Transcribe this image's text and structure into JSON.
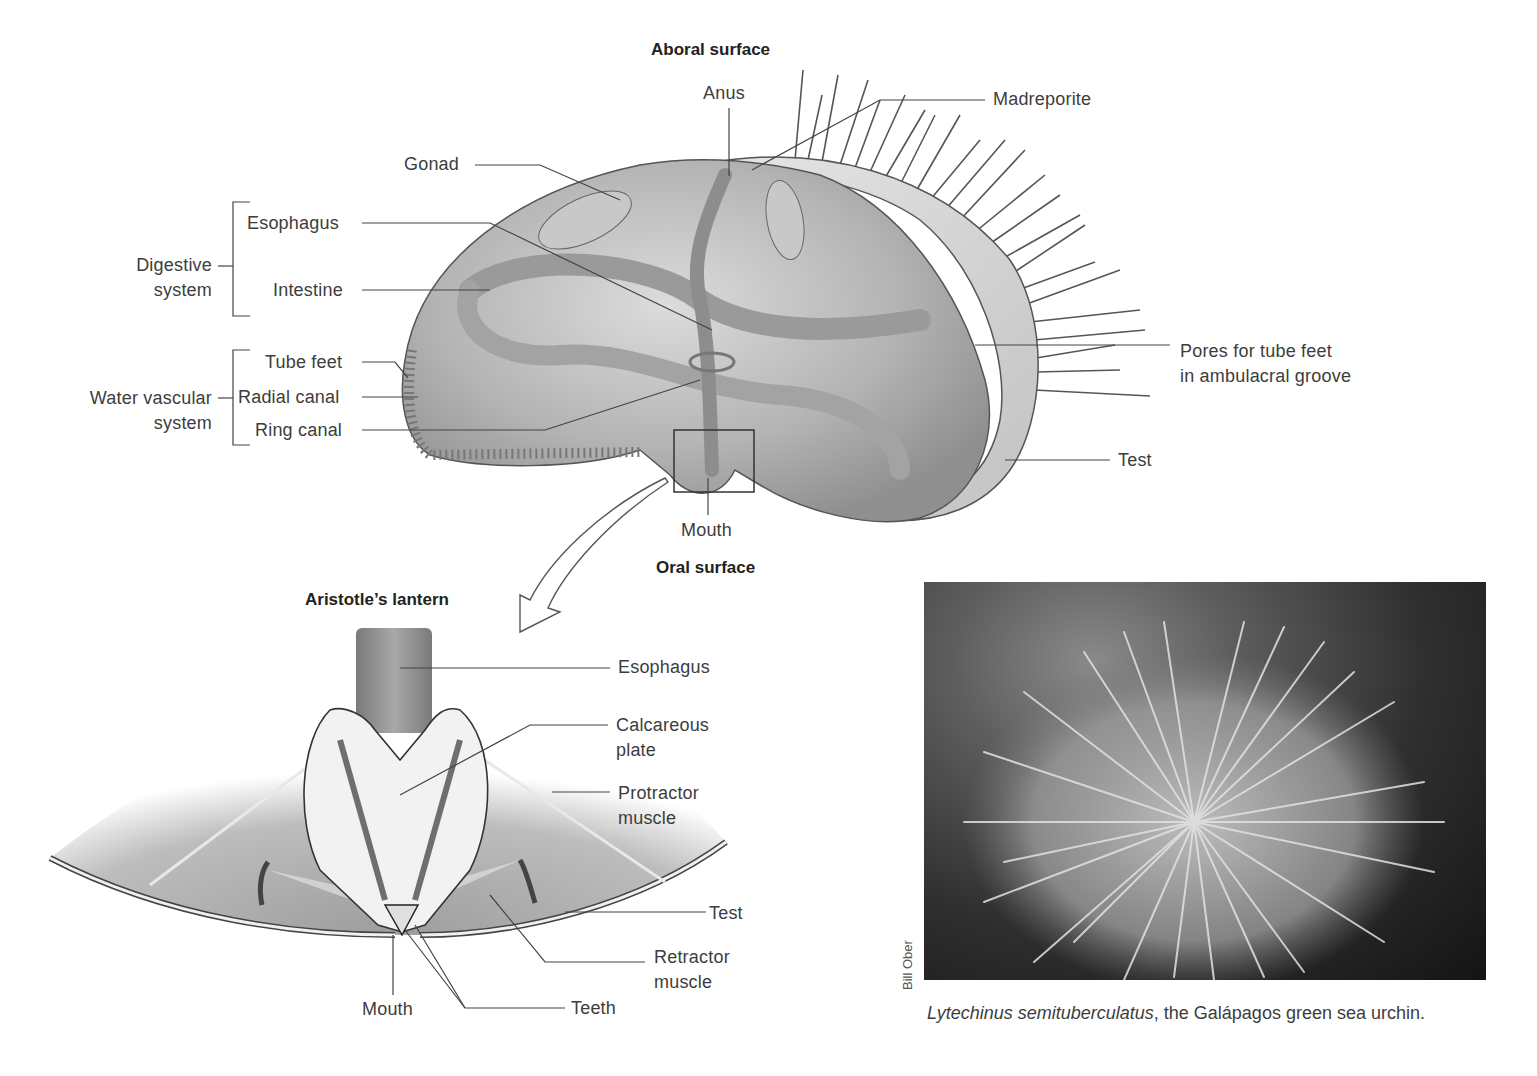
{
  "figure": {
    "top_diagram": {
      "heading_aboral": "Aboral surface",
      "heading_oral": "Oral surface",
      "labels": {
        "anus": "Anus",
        "madreporite": "Madreporite",
        "gonad": "Gonad",
        "esophagus": "Esophagus",
        "intestine": "Intestine",
        "tube_feet": "Tube feet",
        "radial_canal": "Radial canal",
        "ring_canal": "Ring canal",
        "pores": "Pores for tube feet",
        "pores_line2": "in ambulacral groove",
        "test": "Test",
        "mouth": "Mouth"
      },
      "groups": {
        "digestive_line1": "Digestive",
        "digestive_line2": "system",
        "water_line1": "Water vascular",
        "water_line2": "system"
      }
    },
    "lantern_diagram": {
      "heading": "Aristotle’s lantern",
      "labels": {
        "esophagus": "Esophagus",
        "calcareous_line1": "Calcareous",
        "calcareous_line2": "plate",
        "protractor_line1": "Protractor",
        "protractor_line2": "muscle",
        "test": "Test",
        "retractor_line1": "Retractor",
        "retractor_line2": "muscle",
        "mouth": "Mouth",
        "teeth": "Teeth"
      }
    },
    "photo": {
      "credit": "Bill Ober",
      "caption_species": "Lytechinus semituberculatus",
      "caption_rest": ", the Galápagos green sea urchin."
    }
  }
}
